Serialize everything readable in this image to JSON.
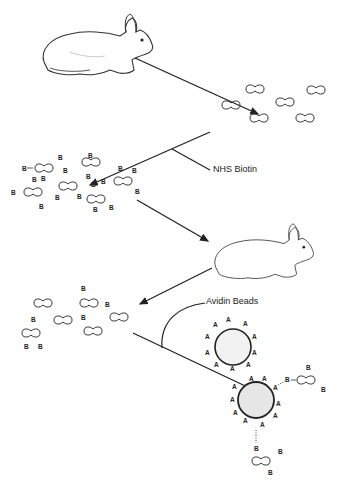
{
  "diagram": {
    "labels": {
      "reagent_1": "NHS Biotin",
      "reagent_2": "Avidin Beads",
      "biotin_mark": "B",
      "avidin_mark": "A"
    },
    "steps": [
      {
        "id": 1,
        "description": "Rabbit produces antibodies"
      },
      {
        "id": 2,
        "description": "Unlabeled antibodies"
      },
      {
        "id": 3,
        "description": "Antibodies labeled with NHS Biotin"
      },
      {
        "id": 4,
        "description": "Biotinylated antibodies injected into rabbit"
      },
      {
        "id": 5,
        "description": "Mixture of labeled and unlabeled antibodies"
      },
      {
        "id": 6,
        "description": "Avidin beads capture biotinylated antibodies"
      }
    ],
    "colors": {
      "line": "#222222",
      "bead_fill": "#eeeeee",
      "background": "#ffffff"
    }
  }
}
